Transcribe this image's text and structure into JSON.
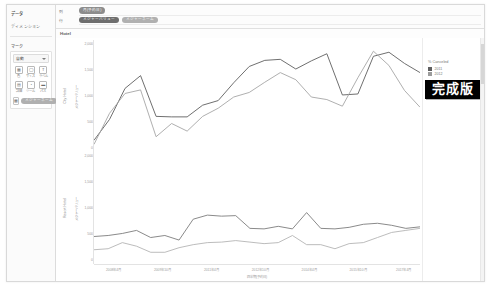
{
  "sidebar": {
    "title": "データ",
    "section_label": "ディメンション",
    "marks_header": "マーク",
    "marks_select": "自動",
    "marks": [
      {
        "icon": "▦",
        "label": "色"
      },
      {
        "icon": "◯",
        "label": "サイズ"
      },
      {
        "icon": "T",
        "label": "ラベル"
      },
      {
        "icon": "▤",
        "label": "詳細"
      },
      {
        "icon": "◔",
        "label": "ツール"
      },
      {
        "icon": "▬",
        "label": "パス"
      }
    ],
    "pill_buttons": [
      "▦",
      "◯",
      "▬"
    ],
    "pill_label": "メジャーネーム",
    "footer_labels": [
      "色の凡例",
      "サイズ",
      "形状"
    ]
  },
  "shelves": {
    "columns_label": "列",
    "rows_label": "行",
    "column_pills": [
      {
        "text": "月(予約日)",
        "style": "blue"
      }
    ],
    "row_pills": [
      {
        "text": "メジャーバリュー",
        "style": "dark"
      },
      {
        "text": "メジャーネーム",
        "style": "light"
      }
    ],
    "sheet_title": "Hotel"
  },
  "legend": {
    "title": "% Canceled",
    "items": [
      {
        "label": "2011",
        "color": "#5f5f5f"
      },
      {
        "label": "2012",
        "color": "#9b9b9b"
      }
    ]
  },
  "badge": {
    "text": "完成版"
  },
  "chart_data": {
    "type": "line",
    "title": "Hotel",
    "xlabel": "四半期(予約日)",
    "legend_position": "right",
    "grid": false,
    "x": [
      "2008年4月",
      "2008年10月",
      "2009年4月",
      "2009年10月",
      "2010年4月",
      "2010年10月",
      "2011年4月",
      "2011年10月",
      "2012年4月",
      "2012年10月",
      "2013年4月",
      "2013年10月",
      "2014年4月",
      "2014年10月",
      "2015年4月",
      "2015年10月",
      "2016年4月",
      "2016年10月",
      "2017年4月",
      "2017年10月"
    ],
    "xtick_labels": [
      "2008年4月",
      "2009年10月",
      "2011年4月",
      "2012年10月",
      "2014年4月",
      "2015年10月",
      "2017年4月"
    ],
    "panels": [
      {
        "row_label": "City Hotel",
        "ylabel": "メジャーバリュー",
        "ylim": [
          0,
          2200
        ],
        "yticks": [
          0,
          500,
          1000,
          1500,
          2000
        ],
        "ytick_labels": [
          "0",
          "500",
          "1,000",
          "1,500",
          "2,000"
        ],
        "series": [
          {
            "name": "2011",
            "color": "#5f5f5f",
            "values": [
              230,
              640,
              1250,
              1500,
              700,
              690,
              690,
              920,
              1010,
              1360,
              1680,
              1800,
              1820,
              1630,
              1790,
              1930,
              1120,
              1140,
              1880,
              1960,
              1740,
              1560
            ]
          },
          {
            "name": "2012",
            "color": "#a6a6a6",
            "values": [
              150,
              760,
              1150,
              1220,
              300,
              560,
              410,
              700,
              860,
              1080,
              1170,
              1370,
              1560,
              1420,
              1080,
              1030,
              900,
              1460,
              1980,
              1700,
              1210,
              880
            ]
          }
        ]
      },
      {
        "row_label": "Resort Hotel",
        "ylabel": "メジャーバリュー",
        "ylim": [
          0,
          2200
        ],
        "yticks": [
          0,
          500,
          1000,
          1500,
          2000
        ],
        "ytick_labels": [
          "0",
          "500",
          "1,000",
          "1,500",
          "2,000"
        ],
        "series": [
          {
            "name": "2011",
            "color": "#7d7d7d",
            "values": [
              540,
              560,
              600,
              660,
              520,
              560,
              470,
              880,
              960,
              940,
              950,
              700,
              690,
              740,
              690,
              1010,
              700,
              690,
              720,
              780,
              800,
              760,
              700,
              730
            ]
          },
          {
            "name": "2012",
            "color": "#b4b4b4",
            "values": [
              280,
              300,
              420,
              350,
              230,
              230,
              320,
              380,
              420,
              430,
              460,
              430,
              400,
              420,
              560,
              380,
              380,
              300,
              400,
              420,
              520,
              620,
              660,
              700
            ]
          }
        ]
      }
    ]
  }
}
